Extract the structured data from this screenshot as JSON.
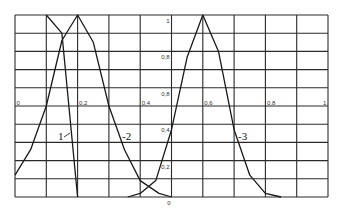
{
  "chart_data": {
    "type": "line",
    "title": "",
    "xlabel": "",
    "ylabel": "",
    "xlim": [
      0,
      1
    ],
    "ylim": [
      0,
      1
    ],
    "grid": true,
    "grid_divisions": {
      "x": 10,
      "y": 10
    },
    "x_tick_labels": [
      {
        "value": 0,
        "label": "0"
      },
      {
        "value": 0.2,
        "label": "0,2"
      },
      {
        "value": 0.4,
        "label": "0,4"
      },
      {
        "value": 0.6,
        "label": "0,6"
      },
      {
        "value": 0.8,
        "label": "0,8"
      },
      {
        "value": 1,
        "label": "1"
      }
    ],
    "y_tick_labels": [
      {
        "value": 1,
        "label": "1"
      },
      {
        "value": 0.8,
        "label": "0,8"
      },
      {
        "value": 0.6,
        "label": "0,8"
      },
      {
        "value": 0.4,
        "label": "0,4"
      },
      {
        "value": 0.2,
        "label": "0,2"
      },
      {
        "value": 0,
        "label": "0"
      }
    ],
    "series": [
      {
        "name": "1",
        "x": [
          0.1,
          0.15,
          0.2
        ],
        "y": [
          1.0,
          0.9,
          0.0
        ]
      },
      {
        "name": "2",
        "x": [
          0.0,
          0.05,
          0.1,
          0.15,
          0.2,
          0.25,
          0.3,
          0.35,
          0.4,
          0.46,
          0.5
        ],
        "y": [
          0.12,
          0.26,
          0.5,
          0.86,
          1.0,
          0.85,
          0.5,
          0.26,
          0.09,
          0.02,
          0.0
        ]
      },
      {
        "name": "3",
        "x": [
          0.36,
          0.4,
          0.45,
          0.5,
          0.55,
          0.6,
          0.65,
          0.7,
          0.75,
          0.8,
          0.85
        ],
        "y": [
          0.0,
          0.02,
          0.09,
          0.37,
          0.77,
          1.0,
          0.8,
          0.37,
          0.12,
          0.02,
          0.0
        ]
      }
    ],
    "annotations": [
      {
        "text": "1",
        "pointer": "1⁄",
        "series": "1"
      },
      {
        "text": "-2",
        "series": "2"
      },
      {
        "text": "-3",
        "series": "3"
      }
    ]
  },
  "labels": {
    "curve1": "1",
    "curve1_tick": "⁄",
    "curve2": "-2",
    "curve3": "-3"
  },
  "colors": {
    "grid": "#2a2a2a",
    "curve": "#1a1a1a",
    "text": "#333333"
  }
}
